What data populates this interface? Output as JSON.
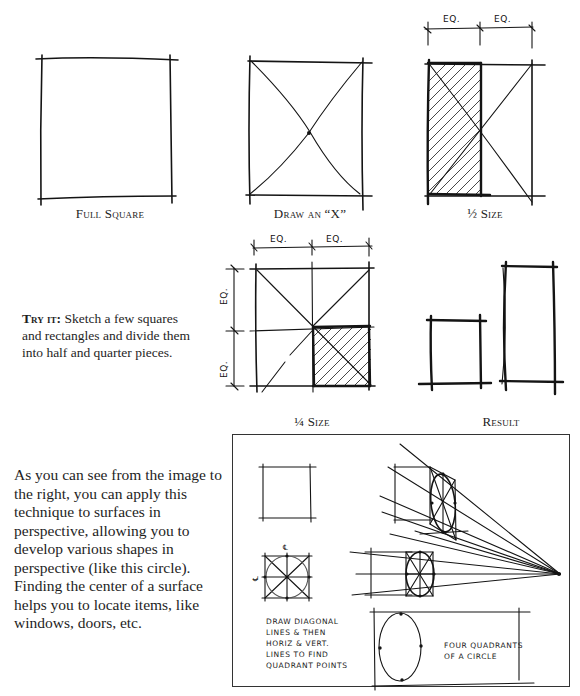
{
  "diagrams": {
    "full_square": {
      "caption": "Full Square"
    },
    "draw_x": {
      "caption": "Draw an “X”"
    },
    "half_size": {
      "caption": "½ Size",
      "dim_labels": [
        "EQ.",
        "EQ."
      ]
    },
    "quarter_size": {
      "caption": "¼ Size",
      "dim_labels_top": [
        "EQ.",
        "EQ."
      ],
      "dim_labels_side": [
        "EQ.",
        "EQ."
      ]
    },
    "result": {
      "caption": "Result"
    }
  },
  "try_it": {
    "heading": "Try it:",
    "text": " Sketch a few squares and rectangles and divide them into half and quarter pieces."
  },
  "perspective_paragraph": {
    "text": "As you can see from the image to the right, you can apply this technique to surfaces in perspective, allowing you to develop various shapes in perspective (like this circle). Finding the center of a surface helps you to locate items, like windows, doors, etc."
  },
  "perspective_figure": {
    "note_left": [
      "DRAW DIAGONAL",
      "LINES & THEN",
      "HORIZ & VERT.",
      "LINES TO FIND",
      "QUADRANT POINTS"
    ],
    "note_right": [
      "FOUR QUADRANTS",
      "OF A CIRCLE"
    ],
    "centerline_symbol": "℄"
  },
  "colors": {
    "ink": "#141414",
    "paper": "#ffffff",
    "frame": "#333333"
  }
}
